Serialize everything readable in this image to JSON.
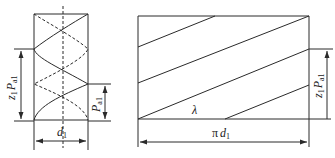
{
  "figure": {
    "left": {
      "title": "worm thread cylinder view",
      "labels": {
        "lead_total": "z",
        "lead_total_sub1": "1",
        "lead_total_P": "P",
        "lead_total_sub2": "a1",
        "axial_pitch": "P",
        "axial_pitch_sub": "a1",
        "diameter": "d",
        "diameter_sub": "1"
      }
    },
    "right": {
      "title": "unrolled helix development",
      "labels": {
        "lead_angle": "λ",
        "circumference_pi": "π",
        "circumference_d": "d",
        "circumference_sub": "1",
        "lead": "z",
        "lead_sub1": "1",
        "lead_P": "P",
        "lead_sub2": "a1"
      }
    },
    "colors": {
      "line": "#2a2a2a",
      "background": "#ffffff"
    }
  }
}
